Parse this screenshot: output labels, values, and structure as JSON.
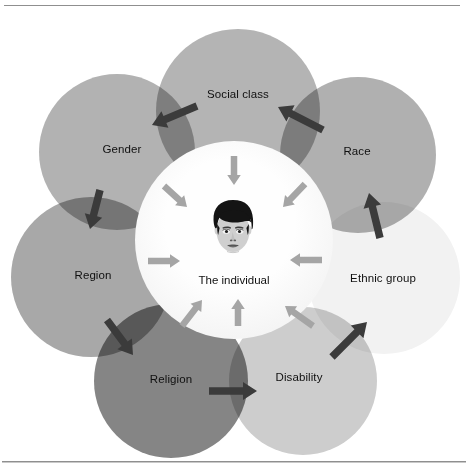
{
  "figure": {
    "title_visible": false,
    "center": {
      "label": "The individual",
      "cx": 234,
      "cy": 281,
      "core_cx": 234,
      "core_cy": 240,
      "core_r": 99,
      "core_color_inner": "#fefefe",
      "core_color_outer": "#ededed",
      "face": {
        "cx": 233,
        "cy": 228,
        "hair_color": "#141414",
        "skin_color": "#cfcfcf",
        "feature_color": "#5a5a5a"
      }
    },
    "petals": [
      {
        "id": "social-class",
        "label": "Social class",
        "cx": 238,
        "cy": 111,
        "r": 82,
        "color": "#b4b4b4",
        "label_x": 238,
        "label_y": 95
      },
      {
        "id": "race",
        "label": "Race",
        "cx": 358,
        "cy": 155,
        "r": 78,
        "color": "#b0b0b0",
        "label_x": 357,
        "label_y": 152
      },
      {
        "id": "ethnic-group",
        "label": "Ethnic group",
        "cx": 384,
        "cy": 278,
        "r": 76,
        "color": "#f2f2f2",
        "label_x": 383,
        "label_y": 279
      },
      {
        "id": "disability",
        "label": "Disability",
        "cx": 303,
        "cy": 381,
        "r": 74,
        "color": "#cdcdcd",
        "label_x": 299,
        "label_y": 378
      },
      {
        "id": "religion",
        "label": "Religion",
        "cx": 171,
        "cy": 381,
        "r": 77,
        "color": "#858585",
        "label_x": 171,
        "label_y": 380
      },
      {
        "id": "region",
        "label": "Region",
        "cx": 91,
        "cy": 277,
        "r": 80,
        "color": "#a8a8a8",
        "label_x": 93,
        "label_y": 276
      },
      {
        "id": "gender",
        "label": "Gender",
        "cx": 117,
        "cy": 152,
        "r": 78,
        "color": "#b2b2b2",
        "label_x": 122,
        "label_y": 150
      }
    ],
    "outer_arrows": {
      "color": "#3b3b3b",
      "description": "dark arrows linking adjacent outer circles in a ring",
      "count": 7,
      "segments": [
        {
          "id": "arrow-socialclass-to-gender",
          "from": "social-class",
          "to": "gender",
          "x1": 197,
          "y1": 106,
          "x2": 152,
          "y2": 125
        },
        {
          "id": "arrow-race-to-socialclass",
          "from": "race",
          "to": "social-class",
          "x1": 323,
          "y1": 130,
          "x2": 278,
          "y2": 107
        },
        {
          "id": "arrow-ethnicgroup-to-race",
          "from": "ethnic-group",
          "to": "race",
          "x1": 380,
          "y1": 238,
          "x2": 369,
          "y2": 193
        },
        {
          "id": "arrow-disability-to-ethnicgroup",
          "from": "disability",
          "to": "ethnic-group",
          "x1": 332,
          "y1": 357,
          "x2": 367,
          "y2": 322
        },
        {
          "id": "arrow-religion-to-disability",
          "from": "religion",
          "to": "disability",
          "x1": 209,
          "y1": 391,
          "x2": 257,
          "y2": 391
        },
        {
          "id": "arrow-region-to-religion",
          "from": "region",
          "to": "religion",
          "x1": 107,
          "y1": 320,
          "x2": 133,
          "y2": 355
        },
        {
          "id": "arrow-gender-to-region",
          "from": "gender",
          "to": "region",
          "x1": 100,
          "y1": 190,
          "x2": 90,
          "y2": 229
        }
      ]
    },
    "inner_arrows": {
      "color": "#a5a5a5",
      "description": "light arrows pointing inward toward the individual",
      "count": 8,
      "segments": [
        {
          "id": "inner-arrow-top",
          "angle_deg": 90,
          "x1": 234,
          "y1": 156,
          "x2": 234,
          "y2": 185
        },
        {
          "id": "inner-arrow-top-right",
          "angle_deg": 45,
          "x1": 305,
          "y1": 184,
          "x2": 283,
          "y2": 207
        },
        {
          "id": "inner-arrow-right",
          "angle_deg": 0,
          "x1": 322,
          "y1": 260,
          "x2": 290,
          "y2": 260
        },
        {
          "id": "inner-arrow-bottom-right",
          "angle_deg": -45,
          "x1": 313,
          "y1": 326,
          "x2": 285,
          "y2": 306
        },
        {
          "id": "inner-arrow-bottom",
          "angle_deg": -90,
          "x1": 238,
          "y1": 326,
          "x2": 238,
          "y2": 299
        },
        {
          "id": "inner-arrow-bottom-left",
          "angle_deg": -135,
          "x1": 182,
          "y1": 326,
          "x2": 202,
          "y2": 300
        },
        {
          "id": "inner-arrow-left",
          "angle_deg": 180,
          "x1": 148,
          "y1": 261,
          "x2": 180,
          "y2": 261
        },
        {
          "id": "inner-arrow-top-left",
          "angle_deg": 135,
          "x1": 164,
          "y1": 186,
          "x2": 187,
          "y2": 207
        }
      ]
    }
  }
}
